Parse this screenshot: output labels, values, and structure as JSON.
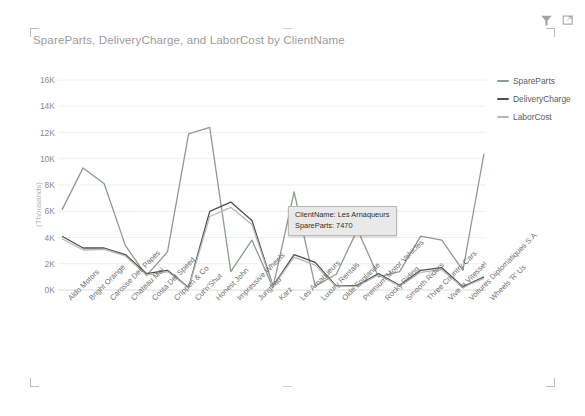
{
  "visual": {
    "title": "SpareParts, DeliveryCharge, and LaborCost by ClientName",
    "header_icons": [
      {
        "name": "filter-icon",
        "label": "Filter"
      },
      {
        "name": "focus-mode-icon",
        "label": "Focus mode"
      }
    ]
  },
  "legend": {
    "position": "right",
    "items": [
      {
        "label": "SpareParts",
        "color": "#8b9d8b"
      },
      {
        "label": "DeliveryCharge",
        "color": "#4f4f4f"
      },
      {
        "label": "LaborCost",
        "color": "#b6b6b6"
      }
    ]
  },
  "tooltip": {
    "visible": true,
    "category_line": "ClientName: Les Arnaqueurs",
    "value_line": "SpareParts: 7470",
    "category": "Les Arnaqueurs",
    "measure": "SpareParts",
    "value": 7470
  },
  "axis": {
    "y_title": "(Thousands)",
    "y_ticks": [
      "0K",
      "2K",
      "4K",
      "6K",
      "8K",
      "10K",
      "12K",
      "14K",
      "16K"
    ]
  },
  "chart_data": {
    "type": "line",
    "title": "SpareParts, DeliveryCharge, and LaborCost by ClientName",
    "xlabel": "ClientName",
    "ylabel": "(Thousands)",
    "ylim": [
      0,
      16000
    ],
    "ytick_values": [
      0,
      2000,
      4000,
      6000,
      8000,
      10000,
      12000,
      14000,
      16000
    ],
    "ytick_labels": [
      "0K",
      "2K",
      "4K",
      "6K",
      "8K",
      "10K",
      "12K",
      "14K",
      "16K"
    ],
    "grid": true,
    "legend_position": "right",
    "categories": [
      "Aldo Motors",
      "Bright Orange",
      "Carosse Des Papes",
      "Chateau Moi",
      "Costa Del Speed",
      "Crippen & Co",
      "Cut'n'Shut",
      "Honest John",
      "Impressive Wheels",
      "Jungfrau",
      "Karz",
      "Les Arnaqueurs",
      "Luxury Rentals",
      "Olde Englande",
      "Premium Motor Vehicles",
      "Rocky Riding",
      "Smooth Riders",
      "Three Country Cars",
      "Vive la Vitesse!",
      "Voitures Diplomatiques S.A.",
      "Wheels 'R' Us"
    ],
    "series": [
      {
        "name": "SpareParts",
        "color": "#8b9d8b",
        "values": [
          6100,
          9300,
          8100,
          3400,
          1100,
          2900,
          11900,
          12400,
          1400,
          3800,
          200,
          7470,
          300,
          1200,
          4600,
          1000,
          1400,
          4100,
          3800,
          1500,
          10400
        ]
      },
      {
        "name": "DeliveryCharge",
        "color": "#4f4f4f",
        "values": [
          4100,
          3200,
          3200,
          2700,
          1250,
          1500,
          200,
          6000,
          6700,
          5300,
          300,
          2700,
          2100,
          300,
          350,
          1250,
          350,
          1500,
          1700,
          250,
          1000
        ]
      },
      {
        "name": "LaborCost",
        "color": "#b6b6b6",
        "values": [
          3900,
          3050,
          3100,
          2600,
          1150,
          1400,
          150,
          5600,
          6300,
          5000,
          250,
          2500,
          1900,
          250,
          300,
          1150,
          300,
          1350,
          1550,
          200,
          900
        ]
      }
    ]
  }
}
